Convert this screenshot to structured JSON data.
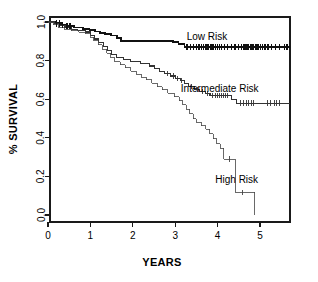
{
  "figure": {
    "kind": "kaplan-meier-survival-plot",
    "background_color": "#ffffff",
    "frame_color": "#1a1a1a"
  },
  "axes": {
    "x_title": "YEARS",
    "y_title": "% SURVIVAL",
    "x_ticks": [
      "0",
      "1",
      "2",
      "3",
      "4",
      "5"
    ],
    "y_ticks": [
      "0.0",
      "0.2",
      "0.4",
      "0.6",
      "0.8",
      "1.0"
    ]
  },
  "labels": {
    "low": "Low Risk",
    "intermediate": "Intermediate Risk",
    "high": "High Risk"
  },
  "chart_data": {
    "type": "line",
    "title": "",
    "subtitle": "",
    "xlabel": "YEARS",
    "ylabel": "% SURVIVAL",
    "xlim": [
      0,
      5.7
    ],
    "ylim": [
      0.0,
      1.0
    ],
    "xticks": [
      0,
      1,
      2,
      3,
      4,
      5
    ],
    "yticks": [
      0.0,
      0.2,
      0.4,
      0.6,
      0.8,
      1.0
    ],
    "grid": false,
    "legend_position": "inline-annotations",
    "step_interpolation": "post",
    "annotations": [
      {
        "text": "Low Risk",
        "x": 3.75,
        "y": 0.925
      },
      {
        "text": "Intermediate Risk",
        "x": 4.05,
        "y": 0.655
      },
      {
        "text": "High Risk",
        "x": 4.45,
        "y": 0.185
      }
    ],
    "series": [
      {
        "name": "Low Risk",
        "stroke_width": 1.8,
        "color": "#111111",
        "points": [
          [
            0.0,
            1.0
          ],
          [
            0.18,
            1.0
          ],
          [
            0.18,
            0.993
          ],
          [
            0.3,
            0.993
          ],
          [
            0.3,
            0.986
          ],
          [
            0.42,
            0.986
          ],
          [
            0.42,
            0.979
          ],
          [
            0.62,
            0.979
          ],
          [
            0.62,
            0.972
          ],
          [
            0.82,
            0.972
          ],
          [
            0.82,
            0.965
          ],
          [
            0.98,
            0.965
          ],
          [
            0.98,
            0.958
          ],
          [
            1.1,
            0.958
          ],
          [
            1.1,
            0.951
          ],
          [
            1.22,
            0.951
          ],
          [
            1.22,
            0.944
          ],
          [
            1.35,
            0.944
          ],
          [
            1.35,
            0.937
          ],
          [
            1.48,
            0.937
          ],
          [
            1.48,
            0.93
          ],
          [
            1.62,
            0.93
          ],
          [
            1.62,
            0.916
          ],
          [
            1.72,
            0.916
          ],
          [
            1.72,
            0.902
          ],
          [
            2.95,
            0.902
          ],
          [
            2.95,
            0.895
          ],
          [
            3.08,
            0.895
          ],
          [
            3.08,
            0.888
          ],
          [
            3.22,
            0.888
          ],
          [
            3.22,
            0.872
          ],
          [
            5.7,
            0.872
          ]
        ],
        "censor_marks": [
          0.2,
          0.27,
          0.34,
          0.45,
          0.52,
          3.28,
          3.36,
          3.43,
          3.5,
          3.56,
          3.62,
          3.67,
          3.71,
          3.75,
          3.79,
          3.83,
          3.87,
          3.91,
          3.95,
          3.99,
          4.04,
          4.1,
          4.17,
          4.24,
          4.32,
          4.41,
          4.49,
          4.56,
          4.62,
          4.67,
          4.72,
          4.77,
          4.81,
          4.85,
          4.89,
          4.93,
          4.97,
          5.01,
          5.06,
          5.12,
          5.19,
          5.27,
          5.36,
          5.46,
          5.58,
          5.64
        ]
      },
      {
        "name": "Intermediate Risk",
        "stroke_width": 1.1,
        "color": "#333333",
        "points": [
          [
            0.0,
            1.0
          ],
          [
            0.15,
            1.0
          ],
          [
            0.15,
            0.99
          ],
          [
            0.28,
            0.99
          ],
          [
            0.28,
            0.98
          ],
          [
            0.4,
            0.98
          ],
          [
            0.4,
            0.97
          ],
          [
            0.55,
            0.97
          ],
          [
            0.55,
            0.963
          ],
          [
            0.7,
            0.963
          ],
          [
            0.7,
            0.956
          ],
          [
            0.88,
            0.956
          ],
          [
            0.88,
            0.948
          ],
          [
            1.0,
            0.948
          ],
          [
            1.0,
            0.93
          ],
          [
            1.1,
            0.93
          ],
          [
            1.1,
            0.912
          ],
          [
            1.2,
            0.912
          ],
          [
            1.2,
            0.893
          ],
          [
            1.3,
            0.893
          ],
          [
            1.3,
            0.872
          ],
          [
            1.4,
            0.872
          ],
          [
            1.4,
            0.852
          ],
          [
            1.5,
            0.852
          ],
          [
            1.5,
            0.832
          ],
          [
            1.62,
            0.832
          ],
          [
            1.62,
            0.818
          ],
          [
            1.78,
            0.818
          ],
          [
            1.78,
            0.805
          ],
          [
            1.95,
            0.805
          ],
          [
            1.95,
            0.795
          ],
          [
            2.18,
            0.795
          ],
          [
            2.18,
            0.786
          ],
          [
            2.4,
            0.786
          ],
          [
            2.4,
            0.772
          ],
          [
            2.52,
            0.772
          ],
          [
            2.52,
            0.758
          ],
          [
            2.62,
            0.758
          ],
          [
            2.62,
            0.745
          ],
          [
            2.75,
            0.745
          ],
          [
            2.75,
            0.732
          ],
          [
            2.88,
            0.732
          ],
          [
            2.88,
            0.72
          ],
          [
            3.0,
            0.72
          ],
          [
            3.0,
            0.708
          ],
          [
            3.12,
            0.708
          ],
          [
            3.12,
            0.696
          ],
          [
            3.22,
            0.696
          ],
          [
            3.22,
            0.68
          ],
          [
            3.32,
            0.68
          ],
          [
            3.32,
            0.665
          ],
          [
            3.45,
            0.665
          ],
          [
            3.45,
            0.652
          ],
          [
            3.58,
            0.652
          ],
          [
            3.58,
            0.64
          ],
          [
            3.72,
            0.64
          ],
          [
            3.72,
            0.628
          ],
          [
            3.82,
            0.628
          ],
          [
            3.82,
            0.618
          ],
          [
            4.32,
            0.618
          ],
          [
            4.32,
            0.598
          ],
          [
            4.45,
            0.598
          ],
          [
            4.45,
            0.58
          ],
          [
            5.7,
            0.58
          ]
        ],
        "censor_marks": [
          2.82,
          2.95,
          3.06,
          3.16,
          3.38,
          3.52,
          3.64,
          3.76,
          3.88,
          3.94,
          3.99,
          4.04,
          4.09,
          4.14,
          4.19,
          4.24,
          4.55,
          4.61,
          4.67,
          4.73,
          4.79,
          4.85,
          5.18,
          5.24,
          5.34,
          5.4,
          5.46
        ]
      },
      {
        "name": "High Risk",
        "stroke_width": 0.8,
        "color": "#444444",
        "points": [
          [
            0.0,
            1.0
          ],
          [
            0.12,
            1.0
          ],
          [
            0.12,
            0.985
          ],
          [
            0.25,
            0.985
          ],
          [
            0.25,
            0.97
          ],
          [
            0.38,
            0.97
          ],
          [
            0.38,
            0.962
          ],
          [
            0.55,
            0.962
          ],
          [
            0.55,
            0.955
          ],
          [
            0.72,
            0.955
          ],
          [
            0.72,
            0.948
          ],
          [
            0.88,
            0.948
          ],
          [
            0.88,
            0.94
          ],
          [
            1.0,
            0.94
          ],
          [
            1.0,
            0.922
          ],
          [
            1.08,
            0.922
          ],
          [
            1.08,
            0.903
          ],
          [
            1.18,
            0.903
          ],
          [
            1.18,
            0.882
          ],
          [
            1.28,
            0.882
          ],
          [
            1.28,
            0.86
          ],
          [
            1.38,
            0.86
          ],
          [
            1.38,
            0.838
          ],
          [
            1.48,
            0.838
          ],
          [
            1.48,
            0.815
          ],
          [
            1.58,
            0.815
          ],
          [
            1.58,
            0.795
          ],
          [
            1.7,
            0.795
          ],
          [
            1.7,
            0.778
          ],
          [
            1.82,
            0.778
          ],
          [
            1.82,
            0.762
          ],
          [
            1.95,
            0.762
          ],
          [
            1.95,
            0.745
          ],
          [
            2.08,
            0.745
          ],
          [
            2.08,
            0.73
          ],
          [
            2.2,
            0.73
          ],
          [
            2.2,
            0.715
          ],
          [
            2.32,
            0.715
          ],
          [
            2.32,
            0.7
          ],
          [
            2.45,
            0.7
          ],
          [
            2.45,
            0.682
          ],
          [
            2.58,
            0.682
          ],
          [
            2.58,
            0.665
          ],
          [
            2.7,
            0.665
          ],
          [
            2.7,
            0.648
          ],
          [
            2.82,
            0.648
          ],
          [
            2.82,
            0.63
          ],
          [
            2.98,
            0.63
          ],
          [
            2.98,
            0.612
          ],
          [
            3.1,
            0.612
          ],
          [
            3.1,
            0.592
          ],
          [
            3.18,
            0.592
          ],
          [
            3.18,
            0.57
          ],
          [
            3.26,
            0.57
          ],
          [
            3.26,
            0.548
          ],
          [
            3.34,
            0.548
          ],
          [
            3.34,
            0.525
          ],
          [
            3.42,
            0.525
          ],
          [
            3.42,
            0.5
          ],
          [
            3.5,
            0.5
          ],
          [
            3.5,
            0.48
          ],
          [
            3.62,
            0.48
          ],
          [
            3.62,
            0.462
          ],
          [
            3.72,
            0.462
          ],
          [
            3.72,
            0.445
          ],
          [
            3.82,
            0.445
          ],
          [
            3.82,
            0.42
          ],
          [
            3.9,
            0.42
          ],
          [
            3.9,
            0.395
          ],
          [
            3.98,
            0.395
          ],
          [
            3.98,
            0.37
          ],
          [
            4.06,
            0.37
          ],
          [
            4.06,
            0.345
          ],
          [
            4.14,
            0.345
          ],
          [
            4.14,
            0.29
          ],
          [
            4.42,
            0.29
          ],
          [
            4.42,
            0.118
          ],
          [
            4.88,
            0.118
          ],
          [
            4.88,
            0.0
          ]
        ],
        "censor_marks": [
          4.28,
          4.58
        ]
      }
    ]
  }
}
